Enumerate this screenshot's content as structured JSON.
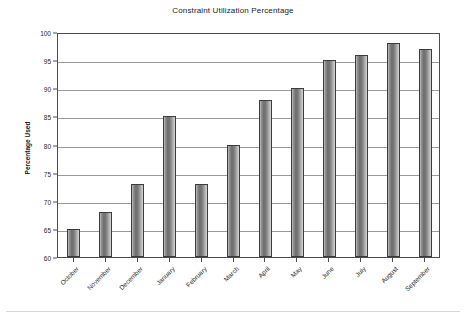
{
  "chart_data": {
    "type": "bar",
    "title": "Constraint Utilization Percentage",
    "xlabel": "",
    "ylabel": "Percentage Used",
    "categories": [
      "October",
      "November",
      "December",
      "January",
      "February",
      "March",
      "April",
      "May",
      "June",
      "July",
      "August",
      "September"
    ],
    "values": [
      65,
      68,
      73,
      85,
      73,
      80,
      88,
      90,
      95,
      96,
      98,
      97
    ],
    "ylim": [
      60,
      100
    ],
    "ytick_labels": [
      "60",
      "65",
      "70",
      "75",
      "80",
      "85",
      "90",
      "95",
      "100"
    ],
    "ytick_values": [
      60,
      65,
      70,
      75,
      80,
      85,
      90,
      95,
      100
    ],
    "grid": "horizontal",
    "legend": "none",
    "series": [
      {
        "name": "Percentage Used",
        "values": [
          65,
          68,
          73,
          85,
          73,
          80,
          88,
          90,
          95,
          96,
          98,
          97
        ]
      }
    ],
    "colors": {
      "bar_fill_dark": "#6e6e6e",
      "bar_fill_light": "#d2d2d2",
      "bar_border": "#3c3c3c",
      "gridline": "#9a9a9a",
      "axis": "#4d4d4d",
      "background": "#ffffff",
      "text": "#1c1c1c"
    }
  }
}
